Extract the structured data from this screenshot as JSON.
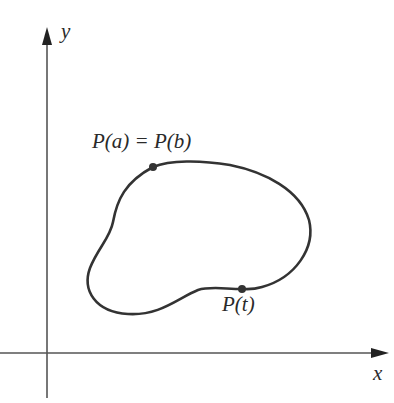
{
  "figure": {
    "type": "parametric closed curve",
    "axes": {
      "x_label": "x",
      "y_label": "y"
    },
    "points": [
      {
        "label": "P(a) = P(b)",
        "description": "start/end point of closed curve"
      },
      {
        "label": "P(t)",
        "description": "generic point on curve"
      }
    ],
    "colors": {
      "stroke": "#333333",
      "background": "#ffffff"
    }
  }
}
